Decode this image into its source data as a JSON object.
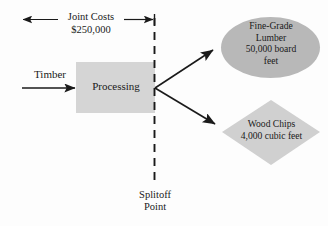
{
  "diagram": {
    "background_color": "#fdfdfd",
    "stroke_color": "#1a1a1a",
    "box_fill": "#d5d5d5",
    "ellipse_fill": "#b8b8b8",
    "diamond_fill": "#d0d0d0"
  },
  "joint_costs": {
    "label": "Joint Costs",
    "amount": "$250,000"
  },
  "input": {
    "label": "Timber"
  },
  "process": {
    "label": "Processing"
  },
  "splitoff": {
    "line1": "Splitoff",
    "line2": "Point"
  },
  "products": [
    {
      "name": "lumber",
      "shape": "ellipse",
      "line1": "Fine-Grade",
      "line2": "Lumber",
      "line3": "50,000 board",
      "line4": "feet"
    },
    {
      "name": "wood-chips",
      "shape": "diamond",
      "line1": "Wood Chips",
      "line2": "4,000 cubic feet"
    }
  ]
}
